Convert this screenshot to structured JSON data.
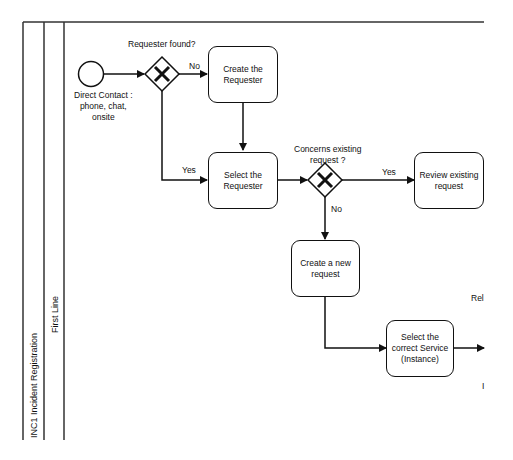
{
  "pool": {
    "label": "INC1 Incident Registration"
  },
  "lane": {
    "label": "First Line"
  },
  "start_event": {
    "label": "Direct Contact :\nphone, chat,\nonsite"
  },
  "gateways": [
    {
      "id": "gw1",
      "label": "Requester found?",
      "icon": "x-exclusive-gateway-icon"
    },
    {
      "id": "gw2",
      "label": "Concerns existing\nrequest ?",
      "icon": "x-exclusive-gateway-icon"
    }
  ],
  "tasks": [
    {
      "id": "create_requester",
      "label": "Create the\nRequester"
    },
    {
      "id": "select_requester",
      "label": "Select the\nRequester"
    },
    {
      "id": "review_request",
      "label": "Review existing\nrequest"
    },
    {
      "id": "create_request",
      "label": "Create a new\nrequest"
    },
    {
      "id": "select_service",
      "label": "Select the\ncorrect Service\n(Instance)"
    }
  ],
  "flow_labels": {
    "gw1_no": "No",
    "gw1_yes": "Yes",
    "gw2_yes": "Yes",
    "gw2_no": "No"
  },
  "cutoff_text": {
    "right_1": "Rel",
    "right_2": "I"
  }
}
